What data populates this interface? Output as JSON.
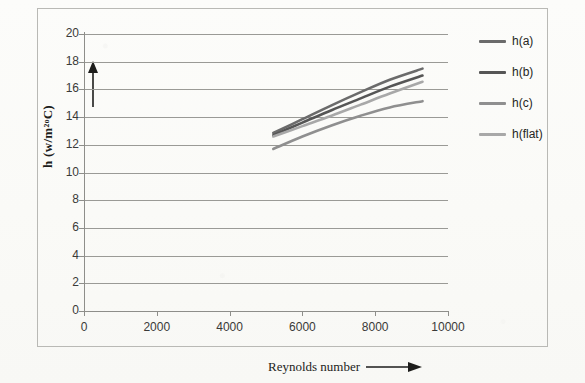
{
  "scan": {
    "clipped_top_text": "· · ·"
  },
  "axes": {
    "y_title": "h  (w/m2oC)",
    "y_title_display": "h  (w/m²ᵒC)",
    "x_title": "Reynolds number",
    "x_arrow_icon": "right-arrow-icon",
    "y_arrow_icon": "up-arrow-icon",
    "y_ticks": [
      "0",
      "2",
      "4",
      "6",
      "8",
      "10",
      "12",
      "14",
      "16",
      "18",
      "20"
    ],
    "x_ticks": [
      "0",
      "2000",
      "4000",
      "6000",
      "8000",
      "10000"
    ]
  },
  "legend": {
    "items": [
      {
        "label": "h(a)",
        "color": "#6b6b6b"
      },
      {
        "label": "h(b)",
        "color": "#565656"
      },
      {
        "label": "h(c)",
        "color": "#8f8f8f"
      },
      {
        "label": "h(flat)",
        "color": "#a8a8a8"
      }
    ]
  },
  "chart_data": {
    "type": "line",
    "title": "",
    "xlabel": "Reynolds number",
    "ylabel": "h (w/m2oC)",
    "xlim": [
      0,
      10000
    ],
    "ylim": [
      0,
      20
    ],
    "xticks": [
      0,
      2000,
      4000,
      6000,
      8000,
      10000
    ],
    "yticks": [
      0,
      2,
      4,
      6,
      8,
      10,
      12,
      14,
      16,
      18,
      20
    ],
    "grid": "horizontal",
    "legend_position": "right",
    "series": [
      {
        "name": "h(a)",
        "color": "#6b6b6b",
        "x": [
          5200,
          6000,
          6800,
          7600,
          8400,
          9300
        ],
        "y": [
          12.85,
          13.85,
          14.85,
          15.8,
          16.7,
          17.5
        ]
      },
      {
        "name": "h(b)",
        "color": "#565656",
        "x": [
          5200,
          6000,
          6800,
          7600,
          8400,
          9300
        ],
        "y": [
          12.7,
          13.6,
          14.5,
          15.35,
          16.2,
          17.0
        ]
      },
      {
        "name": "h(c)",
        "color": "#8f8f8f",
        "x": [
          5200,
          6000,
          6800,
          7600,
          8400,
          9300
        ],
        "y": [
          11.7,
          12.6,
          13.4,
          14.1,
          14.7,
          15.15
        ]
      },
      {
        "name": "h(flat)",
        "color": "#a8a8a8",
        "x": [
          5200,
          6000,
          6800,
          7600,
          8400,
          9300
        ],
        "y": [
          12.6,
          13.35,
          14.1,
          14.9,
          15.7,
          16.55
        ]
      }
    ]
  }
}
